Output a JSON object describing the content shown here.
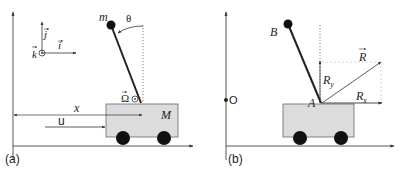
{
  "panel_a": {
    "caption": "(a)",
    "mass_label": "m",
    "angle_label": "θ",
    "cart_mass_label": "M",
    "omega_label": "Ω",
    "x_label": "x",
    "u_label": "u",
    "frame": {
      "i_label": "i",
      "j_label": "j",
      "k_label": "k"
    }
  },
  "panel_b": {
    "caption": "(b)",
    "origin_label": "O",
    "tip_label": "B",
    "pivot_label": "A",
    "force_label": "R",
    "force_x_label": "R",
    "force_x_sub": "x",
    "force_y_label": "R",
    "force_y_sub": "y"
  },
  "colors": {
    "line": "#222222",
    "cart_fill": "#dcdcdc",
    "cart_stroke": "#555555",
    "wheel": "#111111",
    "guide": "#777777"
  }
}
